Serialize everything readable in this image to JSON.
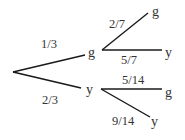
{
  "diagram": {
    "type": "probability-tree",
    "root": {
      "branches": [
        {
          "id": "g",
          "probability": "1/3",
          "outcome": "g",
          "branches": [
            {
              "probability": "2/7",
              "outcome": "g"
            },
            {
              "probability": "5/7",
              "outcome": "y"
            }
          ]
        },
        {
          "id": "y",
          "probability": "2/3",
          "outcome": "y",
          "branches": [
            {
              "probability": "5/14",
              "outcome": "g"
            },
            {
              "probability": "9/14",
              "outcome": "y"
            }
          ]
        }
      ]
    },
    "labels": {
      "level1_g_prob": "1/3",
      "level1_y_prob": "2/3",
      "level1_g_node": "g",
      "level1_y_node": "y",
      "g_g_prob": "2/7",
      "g_y_prob": "5/7",
      "g_g_leaf": "g",
      "g_y_leaf": "y",
      "y_g_prob": "5/14",
      "y_y_prob": "9/14",
      "y_g_leaf": "g",
      "y_y_leaf": "y"
    },
    "colors": {
      "line": "#1a1a1a",
      "text": "#333333",
      "background": "#ffffff"
    }
  }
}
